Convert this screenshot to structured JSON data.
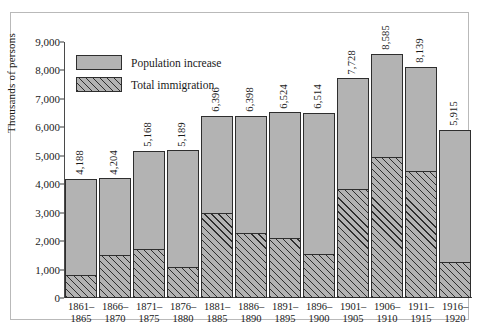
{
  "chart_data": {
    "type": "bar",
    "title": "",
    "xlabel": "",
    "ylabel": "Thousands of persons",
    "ylim": [
      0,
      9000
    ],
    "yticks": [
      0,
      1000,
      2000,
      3000,
      4000,
      5000,
      6000,
      7000,
      8000,
      9000
    ],
    "ytick_labels": [
      "0",
      "1,000",
      "2,000",
      "3,000",
      "4,000",
      "5,000",
      "6,000",
      "7,000",
      "8,000",
      "9,000"
    ],
    "grid": false,
    "legend_position": "top-left",
    "categories": [
      "1861–1865",
      "1866–1870",
      "1871–1875",
      "1876–1880",
      "1881–1885",
      "1886–1890",
      "1891–1895",
      "1896–1900",
      "1901–1905",
      "1906–1910",
      "1911–1915",
      "1916–1920"
    ],
    "category_lines": [
      [
        "1861–",
        "1865"
      ],
      [
        "1866–",
        "1870"
      ],
      [
        "1871–",
        "1875"
      ],
      [
        "1876–",
        "1880"
      ],
      [
        "1881–",
        "1885"
      ],
      [
        "1886–",
        "1890"
      ],
      [
        "1891–",
        "1895"
      ],
      [
        "1896–",
        "1900"
      ],
      [
        "1901–",
        "1905"
      ],
      [
        "1906–",
        "1910"
      ],
      [
        "1911–",
        "1915"
      ],
      [
        "1916–",
        "1920"
      ]
    ],
    "series": [
      {
        "name": "Population increase",
        "style": "solid",
        "values": [
          4188,
          4204,
          5168,
          5189,
          6396,
          6398,
          6524,
          6514,
          7728,
          8585,
          8139,
          5915
        ],
        "labels": [
          "4,188",
          "4,204",
          "5,168",
          "5,189",
          "6,396",
          "6,398",
          "6,524",
          "6,514",
          "7,728",
          "8,585",
          "8,139",
          "5,915"
        ]
      },
      {
        "name": "Total immigration",
        "style": "hatched",
        "values": [
          802,
          1513,
          1727,
          1086,
          2976,
          2271,
          2124,
          1564,
          3833,
          4962,
          4460,
          1276
        ],
        "labels": [
          "802",
          "1,513",
          "1,727",
          "1,086",
          "2,976",
          "2,271",
          "2,124",
          "1,564",
          "3,833",
          "4,962",
          "4,460",
          "1,276"
        ]
      }
    ],
    "colors": {
      "bar_fill": "#b3b3b3",
      "bar_stroke": "#2e2e2e",
      "axis": "#4a4a4a",
      "frame": "#b9b9b9",
      "text": "#1a1a1a",
      "background": "#ffffff"
    }
  }
}
